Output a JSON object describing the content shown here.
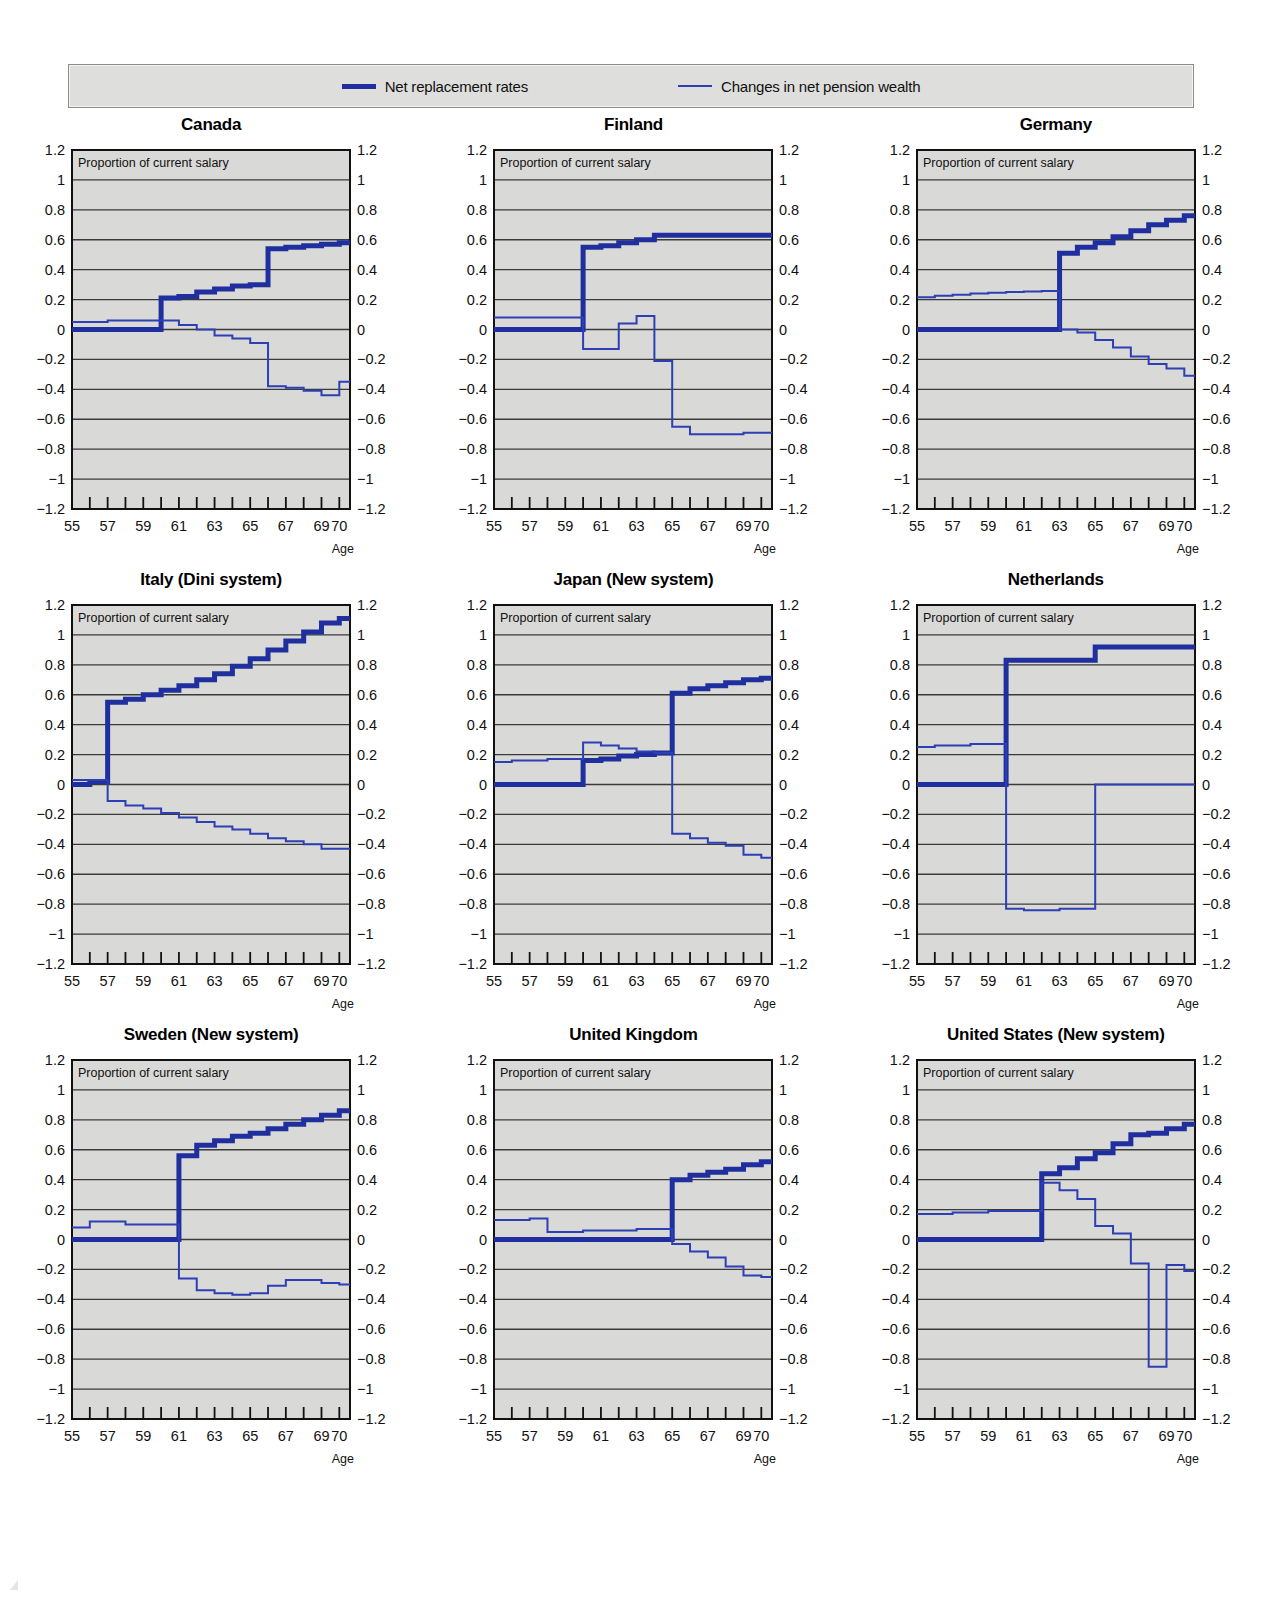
{
  "legend": {
    "items": [
      {
        "label": "Net replacement rates",
        "color": "#1f2f9e",
        "style": "thick"
      },
      {
        "label": "Changes in net pension wealth",
        "color": "#2d3fb5",
        "style": "thin"
      }
    ]
  },
  "axis": {
    "y_ticks": [
      "1.2",
      "1",
      "0.8",
      "0.6",
      "0.4",
      "0.2",
      "0",
      "−0.2",
      "−0.4",
      "−0.6",
      "−0.8",
      "−1",
      "−1.2"
    ],
    "y_values": [
      1.2,
      1,
      0.8,
      0.6,
      0.4,
      0.2,
      0,
      -0.2,
      -0.4,
      -0.6,
      -0.8,
      -1,
      -1.2
    ],
    "x_tick_values": [
      55,
      56,
      57,
      58,
      59,
      60,
      61,
      62,
      63,
      64,
      65,
      66,
      67,
      68,
      69,
      70
    ],
    "x_tick_labels": [
      {
        "v": 55,
        "t": "55"
      },
      {
        "v": 57,
        "t": "57"
      },
      {
        "v": 59,
        "t": "59"
      },
      {
        "v": 61,
        "t": "61"
      },
      {
        "v": 63,
        "t": "63"
      },
      {
        "v": 65,
        "t": "65"
      },
      {
        "v": 67,
        "t": "67"
      },
      {
        "v": 69,
        "t": "69"
      },
      {
        "v": 70,
        "t": "70"
      }
    ],
    "x_label": "Age",
    "inplot_note": "Proportion of current salary",
    "xlim": [
      55,
      70.6
    ],
    "ylim": [
      -1.2,
      1.2
    ],
    "grid": true,
    "plot_bg": "#d9d9d7"
  },
  "chart_data": [
    {
      "type": "line",
      "title": "Canada",
      "xlabel": "Age",
      "ylabel": "Proportion of current salary",
      "xlim": [
        55,
        70.6
      ],
      "ylim": [
        -1.2,
        1.2
      ],
      "x": [
        55,
        56,
        57,
        58,
        59,
        60,
        61,
        62,
        63,
        64,
        65,
        66,
        67,
        68,
        69,
        70
      ],
      "series": [
        {
          "name": "Net replacement rates",
          "style": "thick",
          "color": "#1f2f9e",
          "values": [
            0.0,
            0.0,
            0.0,
            0.0,
            0.0,
            0.21,
            0.22,
            0.25,
            0.27,
            0.29,
            0.3,
            0.54,
            0.55,
            0.56,
            0.57,
            0.58
          ]
        },
        {
          "name": "Changes in net pension wealth",
          "style": "thin",
          "color": "#2d3fb5",
          "values": [
            0.05,
            0.05,
            0.06,
            0.06,
            0.06,
            0.06,
            0.03,
            0.0,
            -0.04,
            -0.06,
            -0.09,
            -0.38,
            -0.39,
            -0.41,
            -0.44,
            -0.35
          ]
        }
      ]
    },
    {
      "type": "line",
      "title": "Finland",
      "xlabel": "Age",
      "ylabel": "Proportion of current salary",
      "xlim": [
        55,
        70.6
      ],
      "ylim": [
        -1.2,
        1.2
      ],
      "x": [
        55,
        56,
        57,
        58,
        59,
        60,
        61,
        62,
        63,
        64,
        65,
        66,
        67,
        68,
        69,
        70
      ],
      "series": [
        {
          "name": "Net replacement rates",
          "style": "thick",
          "color": "#1f2f9e",
          "values": [
            0.0,
            0.0,
            0.0,
            0.0,
            0.0,
            0.55,
            0.56,
            0.58,
            0.6,
            0.63,
            0.63,
            0.63,
            0.63,
            0.63,
            0.63,
            0.63
          ]
        },
        {
          "name": "Changes in net pension wealth",
          "style": "thin",
          "color": "#2d3fb5",
          "values": [
            0.08,
            0.08,
            0.08,
            0.08,
            0.08,
            -0.13,
            -0.13,
            0.04,
            0.09,
            -0.21,
            -0.65,
            -0.7,
            -0.7,
            -0.7,
            -0.69,
            -0.69
          ]
        }
      ]
    },
    {
      "type": "line",
      "title": "Germany",
      "xlabel": "Age",
      "ylabel": "Proportion of current salary",
      "xlim": [
        55,
        70.6
      ],
      "ylim": [
        -1.2,
        1.2
      ],
      "x": [
        55,
        56,
        57,
        58,
        59,
        60,
        61,
        62,
        63,
        64,
        65,
        66,
        67,
        68,
        69,
        70
      ],
      "series": [
        {
          "name": "Net replacement rates",
          "style": "thick",
          "color": "#1f2f9e",
          "values": [
            0.0,
            0.0,
            0.0,
            0.0,
            0.0,
            0.0,
            0.0,
            0.0,
            0.51,
            0.55,
            0.58,
            0.62,
            0.66,
            0.7,
            0.73,
            0.76
          ]
        },
        {
          "name": "Changes in net pension wealth",
          "style": "thin",
          "color": "#2d3fb5",
          "values": [
            0.215,
            0.225,
            0.232,
            0.24,
            0.246,
            0.25,
            0.254,
            0.258,
            0.0,
            -0.02,
            -0.07,
            -0.12,
            -0.18,
            -0.23,
            -0.26,
            -0.31
          ]
        }
      ]
    },
    {
      "type": "line",
      "title": "Italy (Dini system)",
      "xlabel": "Age",
      "ylabel": "Proportion of current salary",
      "xlim": [
        55,
        70.6
      ],
      "ylim": [
        -1.2,
        1.2
      ],
      "x": [
        55,
        56,
        57,
        58,
        59,
        60,
        61,
        62,
        63,
        64,
        65,
        66,
        67,
        68,
        69,
        70
      ],
      "series": [
        {
          "name": "Net replacement rates",
          "style": "thick",
          "color": "#1f2f9e",
          "values": [
            0.0,
            0.02,
            0.55,
            0.57,
            0.6,
            0.63,
            0.66,
            0.7,
            0.74,
            0.79,
            0.84,
            0.9,
            0.96,
            1.02,
            1.08,
            1.11
          ]
        },
        {
          "name": "Changes in net pension wealth",
          "style": "thin",
          "color": "#2d3fb5",
          "values": [
            0.03,
            0.03,
            -0.11,
            -0.14,
            -0.16,
            -0.19,
            -0.22,
            -0.25,
            -0.28,
            -0.3,
            -0.33,
            -0.36,
            -0.38,
            -0.4,
            -0.43,
            -0.43
          ]
        }
      ]
    },
    {
      "type": "line",
      "title": "Japan (New system)",
      "xlabel": "Age",
      "ylabel": "Proportion of current salary",
      "xlim": [
        55,
        70.6
      ],
      "ylim": [
        -1.2,
        1.2
      ],
      "x": [
        55,
        56,
        57,
        58,
        59,
        60,
        61,
        62,
        63,
        64,
        65,
        66,
        67,
        68,
        69,
        70
      ],
      "series": [
        {
          "name": "Net replacement rates",
          "style": "thick",
          "color": "#1f2f9e",
          "values": [
            0.0,
            0.0,
            0.0,
            0.0,
            0.0,
            0.16,
            0.17,
            0.19,
            0.2,
            0.21,
            0.61,
            0.64,
            0.66,
            0.68,
            0.7,
            0.71
          ]
        },
        {
          "name": "Changes in net pension wealth",
          "style": "thin",
          "color": "#2d3fb5",
          "values": [
            0.15,
            0.16,
            0.16,
            0.17,
            0.17,
            0.28,
            0.26,
            0.24,
            0.22,
            0.21,
            -0.33,
            -0.36,
            -0.39,
            -0.41,
            -0.47,
            -0.49
          ]
        }
      ]
    },
    {
      "type": "line",
      "title": "Netherlands",
      "xlabel": "Age",
      "ylabel": "Proportion of current salary",
      "xlim": [
        55,
        70.6
      ],
      "ylim": [
        -1.2,
        1.2
      ],
      "x": [
        55,
        56,
        57,
        58,
        59,
        60,
        61,
        62,
        63,
        64,
        65,
        66,
        67,
        68,
        69,
        70
      ],
      "series": [
        {
          "name": "Net replacement rates",
          "style": "thick",
          "color": "#1f2f9e",
          "values": [
            0.0,
            0.0,
            0.0,
            0.0,
            0.0,
            0.83,
            0.83,
            0.83,
            0.83,
            0.83,
            0.92,
            0.92,
            0.92,
            0.92,
            0.92,
            0.92
          ]
        },
        {
          "name": "Changes in net pension wealth",
          "style": "thin",
          "color": "#2d3fb5",
          "values": [
            0.25,
            0.26,
            0.26,
            0.27,
            0.27,
            -0.83,
            -0.84,
            -0.84,
            -0.83,
            -0.83,
            0.0,
            0.0,
            0.0,
            0.0,
            0.0,
            0.0
          ]
        }
      ]
    },
    {
      "type": "line",
      "title": "Sweden (New system)",
      "xlabel": "Age",
      "ylabel": "Proportion of current salary",
      "xlim": [
        55,
        70.6
      ],
      "ylim": [
        -1.2,
        1.2
      ],
      "x": [
        55,
        56,
        57,
        58,
        59,
        60,
        61,
        62,
        63,
        64,
        65,
        66,
        67,
        68,
        69,
        70
      ],
      "series": [
        {
          "name": "Net replacement rates",
          "style": "thick",
          "color": "#1f2f9e",
          "values": [
            0.0,
            0.0,
            0.0,
            0.0,
            0.0,
            0.0,
            0.56,
            0.63,
            0.66,
            0.69,
            0.71,
            0.74,
            0.77,
            0.8,
            0.83,
            0.86
          ]
        },
        {
          "name": "Changes in net pension wealth",
          "style": "thin",
          "color": "#2d3fb5",
          "values": [
            0.08,
            0.12,
            0.12,
            0.1,
            0.1,
            0.1,
            -0.26,
            -0.34,
            -0.36,
            -0.37,
            -0.36,
            -0.31,
            -0.27,
            -0.27,
            -0.29,
            -0.3
          ]
        }
      ]
    },
    {
      "type": "line",
      "title": "United Kingdom",
      "xlabel": "Age",
      "ylabel": "Proportion of current salary",
      "xlim": [
        55,
        70.6
      ],
      "ylim": [
        -1.2,
        1.2
      ],
      "x": [
        55,
        56,
        57,
        58,
        59,
        60,
        61,
        62,
        63,
        64,
        65,
        66,
        67,
        68,
        69,
        70
      ],
      "series": [
        {
          "name": "Net replacement rates",
          "style": "thick",
          "color": "#1f2f9e",
          "values": [
            0.0,
            0.0,
            0.0,
            0.0,
            0.0,
            0.0,
            0.0,
            0.0,
            0.0,
            0.0,
            0.4,
            0.43,
            0.45,
            0.47,
            0.5,
            0.52
          ]
        },
        {
          "name": "Changes in net pension wealth",
          "style": "thin",
          "color": "#2d3fb5",
          "values": [
            0.13,
            0.13,
            0.14,
            0.05,
            0.05,
            0.06,
            0.06,
            0.06,
            0.07,
            0.07,
            -0.03,
            -0.08,
            -0.12,
            -0.18,
            -0.24,
            -0.25
          ]
        }
      ]
    },
    {
      "type": "line",
      "title": "United States (New system)",
      "xlabel": "Age",
      "ylabel": "Proportion of current salary",
      "xlim": [
        55,
        70.6
      ],
      "ylim": [
        -1.2,
        1.2
      ],
      "x": [
        55,
        56,
        57,
        58,
        59,
        60,
        61,
        62,
        63,
        64,
        65,
        66,
        67,
        68,
        69,
        70
      ],
      "series": [
        {
          "name": "Net replacement rates",
          "style": "thick",
          "color": "#1f2f9e",
          "values": [
            0.0,
            0.0,
            0.0,
            0.0,
            0.0,
            0.0,
            0.0,
            0.44,
            0.48,
            0.54,
            0.58,
            0.64,
            0.7,
            0.71,
            0.74,
            0.77
          ]
        },
        {
          "name": "Changes in net pension wealth",
          "style": "thin",
          "color": "#2d3fb5",
          "values": [
            0.17,
            0.17,
            0.18,
            0.18,
            0.19,
            0.19,
            0.19,
            0.38,
            0.33,
            0.27,
            0.09,
            0.04,
            -0.16,
            -0.85,
            -0.17,
            -0.21
          ]
        }
      ]
    }
  ]
}
